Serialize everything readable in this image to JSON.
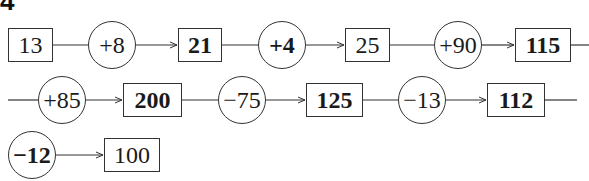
{
  "exercise_number": "4",
  "rows": [
    {
      "nodes": [
        {
          "type": "box",
          "value": "13",
          "bold": false
        },
        {
          "type": "circle",
          "value": "+8",
          "bold": false
        },
        {
          "type": "box",
          "value": "21",
          "bold": true
        },
        {
          "type": "circle",
          "value": "+4",
          "bold": true
        },
        {
          "type": "box",
          "value": "25",
          "bold": false
        },
        {
          "type": "circle",
          "value": "+90",
          "bold": false
        },
        {
          "type": "box",
          "value": "115",
          "bold": true
        }
      ]
    },
    {
      "nodes": [
        {
          "type": "circle",
          "value": "+85",
          "bold": false
        },
        {
          "type": "box",
          "value": "200",
          "bold": true
        },
        {
          "type": "circle",
          "value": "−75",
          "bold": false
        },
        {
          "type": "box",
          "value": "125",
          "bold": true
        },
        {
          "type": "circle",
          "value": "−13",
          "bold": false
        },
        {
          "type": "box",
          "value": "112",
          "bold": true
        }
      ]
    },
    {
      "nodes": [
        {
          "type": "circle",
          "value": "−12",
          "bold": true
        },
        {
          "type": "box",
          "value": "100",
          "bold": false
        }
      ]
    }
  ],
  "colors": {
    "stroke": "#333333",
    "text": "#1a1a1a",
    "background": "#ffffff"
  }
}
